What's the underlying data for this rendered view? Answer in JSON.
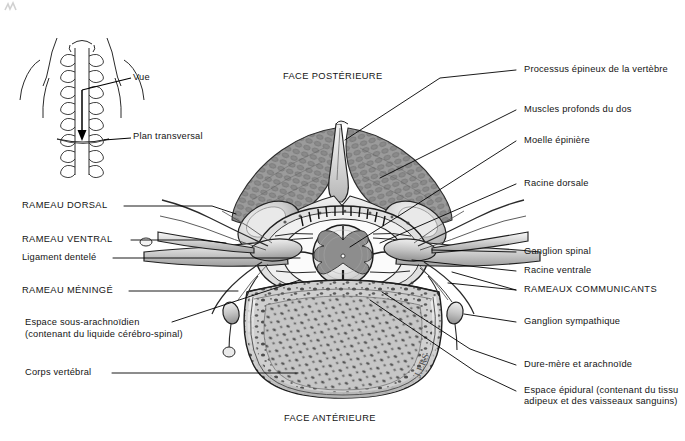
{
  "figure": {
    "title_posterior": "FACE POSTÉRIEURE",
    "title_anterior": "FACE ANTÉRIEURE",
    "signature": "J.ERS",
    "ink_color": "#141414",
    "paper_color": "#ffffff"
  },
  "inset": {
    "name": "neck-posterior-view-inset",
    "labels": {
      "vue": "Vue",
      "plan": "Plan transversal"
    }
  },
  "labels_left": [
    {
      "id": "rameau-dorsal",
      "text": "RAMEAU DORSAL",
      "style": "caps"
    },
    {
      "id": "rameau-ventral",
      "text": "RAMEAU VENTRAL",
      "style": "caps"
    },
    {
      "id": "ligament-dentele",
      "text": "Ligament dentelé",
      "style": "normal"
    },
    {
      "id": "rameau-meninge",
      "text": "RAMEAU MÉNINGÉ",
      "style": "caps"
    },
    {
      "id": "espace-sous-arachnoidien-l1",
      "text": "Espace sous-arachnoïdien",
      "style": "normal"
    },
    {
      "id": "espace-sous-arachnoidien-l2",
      "text": "(contenant du liquide cérébro-spinal)",
      "style": "normal"
    },
    {
      "id": "corps-vertebral",
      "text": "Corps vertébral",
      "style": "normal"
    }
  ],
  "labels_right": [
    {
      "id": "processus-epineux",
      "text": "Processus épineux de la vertèbre",
      "style": "normal"
    },
    {
      "id": "muscles-profonds",
      "text": "Muscles profonds du dos",
      "style": "normal"
    },
    {
      "id": "moelle-epiniere",
      "text": "Moelle épinière",
      "style": "normal"
    },
    {
      "id": "racine-dorsale",
      "text": "Racine dorsale",
      "style": "normal"
    },
    {
      "id": "ganglion-spinal",
      "text": "Ganglion spinal",
      "style": "normal"
    },
    {
      "id": "racine-ventrale",
      "text": "Racine ventrale",
      "style": "normal"
    },
    {
      "id": "rameaux-communicants",
      "text": "RAMEAUX COMMUNICANTS",
      "style": "caps"
    },
    {
      "id": "ganglion-sympathique",
      "text": "Ganglion sympathique",
      "style": "normal"
    },
    {
      "id": "dure-mere",
      "text": "Dure-mère et arachnoïde",
      "style": "normal"
    },
    {
      "id": "espace-epidural-l1",
      "text": "Espace épidural (contenant du tissu",
      "style": "normal"
    },
    {
      "id": "espace-epidural-l2",
      "text": "adipeux et des vaisseaux sanguins)",
      "style": "normal"
    }
  ]
}
